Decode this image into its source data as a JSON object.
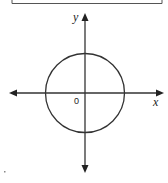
{
  "diagram": {
    "type": "coordinate-plane-with-circle",
    "axes": {
      "x_label": "x",
      "y_label": "y",
      "origin_label": "0",
      "stroke_color": "#333333"
    },
    "circle": {
      "center": [
        0,
        0
      ],
      "stroke_color": "#333333",
      "fill": "none"
    },
    "answer_box": {
      "visible_part": "bottom edge",
      "stroke_color": "#555555"
    }
  }
}
